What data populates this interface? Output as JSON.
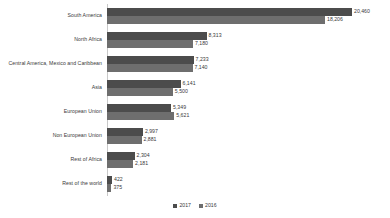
{
  "chart_data": {
    "type": "bar",
    "orientation": "horizontal",
    "title": "",
    "subtitle": "",
    "xlabel": "",
    "ylabel": "",
    "grid": false,
    "legend_position": "bottom-center",
    "xlim": [
      0,
      20460
    ],
    "categories": [
      "South America",
      "North Africa",
      "Central America, Mexico and Caribbean",
      "Asia",
      "European Union",
      "Non European Union",
      "Rest of Africa",
      "Rest of the world"
    ],
    "series": [
      {
        "name": "2017",
        "color": "#4c4c4c",
        "values": [
          20460,
          8313,
          7233,
          6141,
          5349,
          2997,
          2304,
          422
        ],
        "labels": [
          "20,460",
          "8,313",
          "7,233",
          "6,141",
          "5,349",
          "2,997",
          "2,304",
          "422"
        ]
      },
      {
        "name": "2016",
        "color": "#6e6e6e",
        "values": [
          18206,
          7180,
          7140,
          5500,
          5621,
          2881,
          2181,
          375
        ],
        "labels": [
          "18,206",
          "7,180",
          "7,140",
          "5,500",
          "5,621",
          "2,881",
          "2,181",
          "375"
        ]
      }
    ]
  },
  "legend": {
    "items": [
      {
        "label": "2017",
        "color": "#4c4c4c"
      },
      {
        "label": "2016",
        "color": "#6e6e6e"
      }
    ]
  },
  "colors": {
    "series_2017": "#4c4c4c",
    "series_2016": "#6e6e6e",
    "axis": "#c9c9c9",
    "text": "#3a3a3a",
    "background": "#ffffff"
  }
}
